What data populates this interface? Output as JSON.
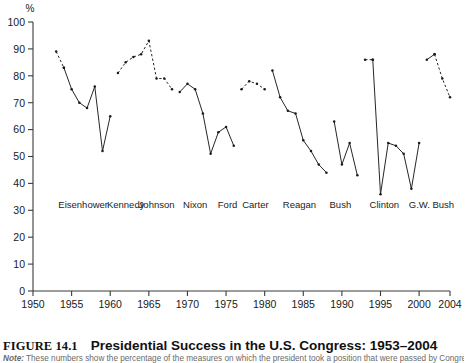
{
  "figure": {
    "number": "FIGURE 14.1",
    "title": "Presidential Success in the U.S. Congress: 1953–2004",
    "note_label": "Note:",
    "note_text": " These numbers show the percentage of the measures on which the president took a position that were passed by Congress."
  },
  "chart_data": {
    "type": "line",
    "title": "Presidential Success in the U.S. Congress: 1953–2004",
    "xlabel": "",
    "ylabel": "%",
    "unit_label": "%",
    "xlim": [
      1950,
      2004
    ],
    "ylim": [
      0,
      100
    ],
    "grid": false,
    "legend": "none",
    "yticks": [
      0,
      10,
      20,
      30,
      40,
      50,
      60,
      70,
      80,
      90,
      100
    ],
    "xticks": [
      1950,
      1955,
      1960,
      1965,
      1970,
      1975,
      1980,
      1985,
      1990,
      1995,
      2000,
      2004
    ],
    "xtick_labels": [
      "1950",
      "1955",
      "1960",
      "1965",
      "1970",
      "1975",
      "1980",
      "1985",
      "1990",
      "1995",
      "2000",
      "2004"
    ],
    "ytick_labels": [
      "0",
      "10",
      "20",
      "30",
      "40",
      "50",
      "60",
      "70",
      "80",
      "90",
      "100"
    ],
    "president_labels": [
      {
        "name": "Eisenhower",
        "year": 1956.5
      },
      {
        "name": "Kennedy",
        "year": 1962.0
      },
      {
        "name": "Johnson",
        "year": 1966.0
      },
      {
        "name": "Nixon",
        "year": 1971.0
      },
      {
        "name": "Ford",
        "year": 1975.2
      },
      {
        "name": "Carter",
        "year": 1978.8
      },
      {
        "name": "Reagan",
        "year": 1984.5
      },
      {
        "name": "Bush",
        "year": 1989.8
      },
      {
        "name": "Clinton",
        "year": 1995.5
      },
      {
        "name": "G.W. Bush",
        "year": 2001.6
      }
    ],
    "label_row_value": 31,
    "series": [
      {
        "name": "Eisenhower",
        "style": "dashed",
        "x": [
          1953,
          1954
        ],
        "values": [
          89,
          83
        ]
      },
      {
        "name": "Eisenhower-Nixon-Ford",
        "style": "solid",
        "x": [
          1954,
          1955,
          1956,
          1957,
          1958,
          1959,
          1960
        ],
        "values": [
          83,
          75,
          70,
          68,
          76,
          52,
          65
        ]
      },
      {
        "name": "Kennedy-Johnson",
        "style": "dashed",
        "x": [
          1961,
          1962,
          1963,
          1964,
          1965,
          1966,
          1967,
          1968
        ],
        "values": [
          81,
          85,
          87,
          88,
          93,
          79,
          79,
          75
        ]
      },
      {
        "name": "Nixon-Ford",
        "style": "solid",
        "x": [
          1969,
          1970,
          1971,
          1972,
          1973,
          1974,
          1975,
          1976
        ],
        "values": [
          74,
          77,
          75,
          66,
          51,
          59,
          61,
          54
        ]
      },
      {
        "name": "Carter",
        "style": "dashed",
        "x": [
          1977,
          1978,
          1979,
          1980
        ],
        "values": [
          75,
          78,
          77,
          75
        ]
      },
      {
        "name": "Reagan-Bush",
        "style": "solid",
        "x": [
          1981,
          1982,
          1983,
          1984,
          1985,
          1986,
          1987,
          1988
        ],
        "values": [
          82,
          72,
          67,
          66,
          56,
          52,
          47,
          44
        ]
      },
      {
        "name": "Bush",
        "style": "solid",
        "x": [
          1989,
          1990,
          1991,
          1992
        ],
        "values": [
          63,
          47,
          55,
          43
        ]
      },
      {
        "name": "Clinton-start",
        "style": "dashed",
        "x": [
          1993,
          1994
        ],
        "values": [
          86,
          86
        ]
      },
      {
        "name": "Clinton",
        "style": "solid",
        "x": [
          1994,
          1995,
          1996,
          1997,
          1998,
          1999,
          2000
        ],
        "values": [
          86,
          36,
          55,
          54,
          51,
          38,
          55
        ]
      },
      {
        "name": "GW-Bush-start",
        "style": "solid",
        "x": [
          2001,
          2002
        ],
        "values": [
          86,
          88
        ]
      },
      {
        "name": "GW-Bush",
        "style": "dashed",
        "x": [
          2002,
          2003,
          2004
        ],
        "values": [
          88,
          79,
          72
        ]
      }
    ]
  }
}
